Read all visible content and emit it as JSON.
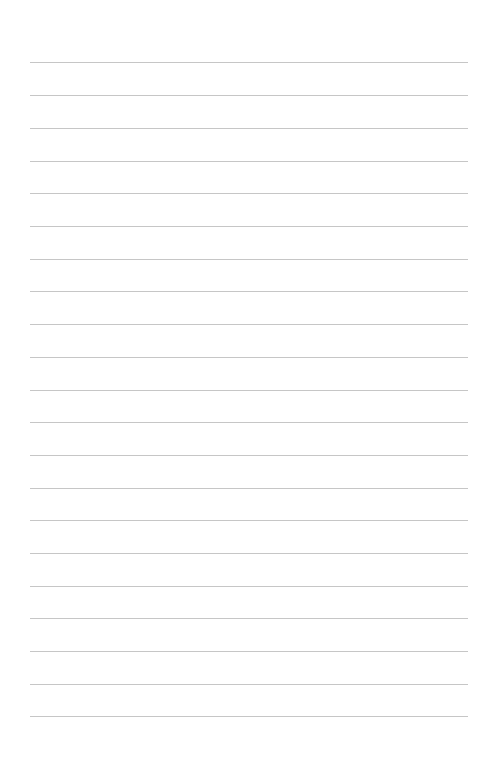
{
  "page": {
    "type": "lined-paper",
    "background_color": "#ffffff",
    "line_color": "#c6c6c6",
    "line_count": 21,
    "line_positions_y": [
      62,
      95,
      128,
      161,
      193,
      226,
      259,
      291,
      324,
      357,
      390,
      422,
      455,
      488,
      520,
      553,
      586,
      618,
      651,
      684,
      716
    ],
    "line_left_x": 30,
    "line_right_x": 468
  }
}
